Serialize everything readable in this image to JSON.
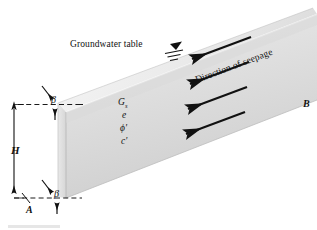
{
  "figure": {
    "type": "infinite-slope-with-seepage-diagram",
    "labels": {
      "groundwater_table": "Groundwater table",
      "direction_of_seepage": "Direction of seepage",
      "height": "H",
      "beta_top": "β",
      "beta_bottom": "β",
      "point_a": "A",
      "point_b": "B"
    },
    "soil_properties": [
      {
        "symbol": "G",
        "subscript": "s",
        "prime": false
      },
      {
        "symbol": "e",
        "subscript": "",
        "prime": false
      },
      {
        "symbol": "ϕ",
        "subscript": "",
        "prime": true
      },
      {
        "symbol": "c",
        "subscript": "",
        "prime": true
      }
    ],
    "soil_property_text": {
      "specific_gravity": "Gs",
      "void_ratio": "e",
      "friction_angle": "ϕ'",
      "cohesion": "c'"
    },
    "seepage_arrow_count": 4,
    "colors": {
      "slope_face_light": "#e3e3e3",
      "slope_face_mid": "#d2d2d2",
      "slope_top_band": "#f0f0f0",
      "outline": "#9a9a9a",
      "ink": "#111111",
      "dashed_line": "#1a1a1a",
      "background": "#ffffff"
    }
  }
}
